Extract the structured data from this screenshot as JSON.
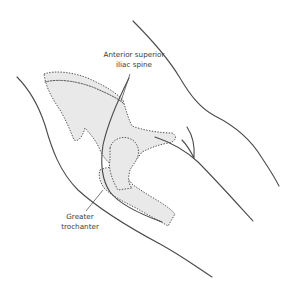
{
  "diagram": {
    "labels": {
      "asis": {
        "line1": "Anterior superior",
        "line2": "iliac spine"
      },
      "greater_trochanter": {
        "line1": "Greater",
        "line2": "trochanter"
      }
    },
    "colors": {
      "background": "#ffffff",
      "bone_fill": "#e9e9e9",
      "outline": "#4a4a4a",
      "text": "#3a3a3a"
    }
  }
}
